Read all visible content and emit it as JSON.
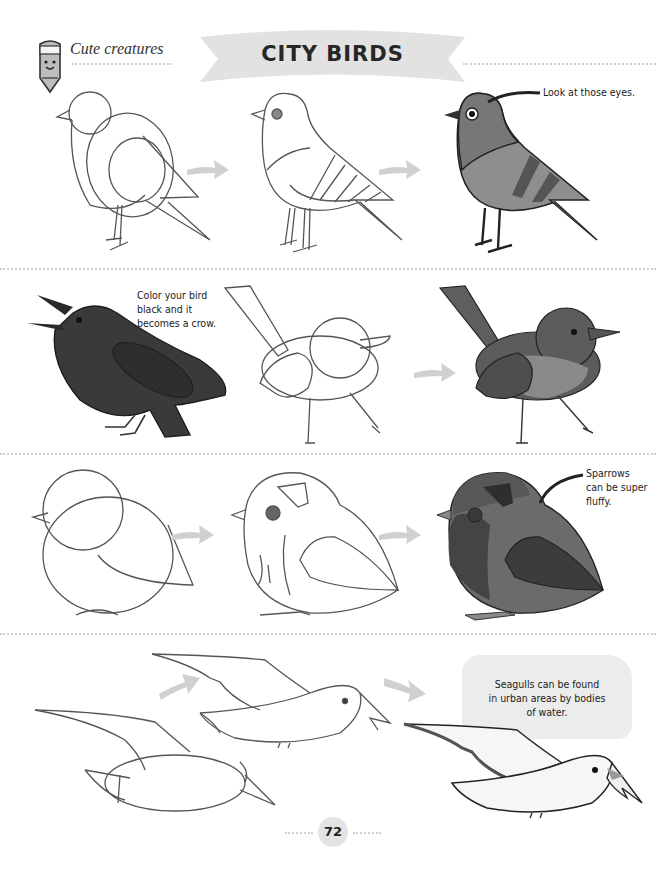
{
  "header": {
    "section_label": "Cute creatures",
    "title": "CITY BIRDS",
    "mascot_icon": "crayon-mascot-icon"
  },
  "rows": [
    {
      "name": "pigeon",
      "steps": [
        "pigeon-step-1-shapes",
        "pigeon-step-2-outline",
        "pigeon-step-3-colored"
      ],
      "note": "Look at those eyes."
    },
    {
      "name": "crow-robin",
      "steps": [
        "crow-colored-example",
        "robin-step-1-shapes",
        "robin-step-2-colored"
      ],
      "note_lines": [
        "Color your bird",
        "black and it",
        "becomes a crow."
      ]
    },
    {
      "name": "sparrow",
      "steps": [
        "sparrow-step-1-shapes",
        "sparrow-step-2-outline",
        "sparrow-step-3-colored"
      ],
      "note_lines": [
        "Sparrows",
        "can be super",
        "fluffy."
      ]
    },
    {
      "name": "seagull",
      "steps": [
        "seagull-step-1-shapes",
        "seagull-step-2-outline",
        "seagull-step-3-colored"
      ],
      "note_lines": [
        "Seagulls can be found",
        "in urban areas by bodies",
        "of water."
      ]
    }
  ],
  "footer": {
    "page_number": "72"
  },
  "colors": {
    "banner": "#e2e2e2",
    "arrow": "#cfcfcf",
    "pigeon_body": "#8e8e8e",
    "pigeon_head": "#7a7a7a",
    "crow": "#3a3a3a",
    "robin_dark": "#5c5c5c",
    "robin_breast": "#8a8a8a",
    "sparrow_dark": "#4b4b4b",
    "sparrow_mid": "#6b6b6b",
    "note_bubble": "#ececec",
    "seagull_body": "#f6f6f6"
  }
}
